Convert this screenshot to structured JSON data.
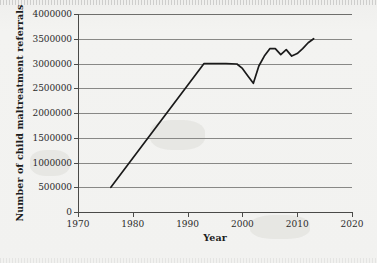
{
  "chart_data": {
    "type": "line",
    "title": "",
    "xlabel": "Year",
    "ylabel": "Number of child maltreatment referrals",
    "xlim": [
      1970,
      2020
    ],
    "ylim": [
      0,
      4000000
    ],
    "grid": true,
    "legend": false,
    "legend_position": "none",
    "xticks": [
      1970,
      1980,
      1990,
      2000,
      2010,
      2020
    ],
    "xtick_labels": [
      "1970",
      "1980",
      "1990",
      "2000",
      "2010",
      "2020"
    ],
    "yticks": [
      0,
      500000,
      1000000,
      1500000,
      2000000,
      2500000,
      3000000,
      3500000,
      4000000
    ],
    "ytick_labels": [
      "0",
      "500000",
      "1000000",
      "1500000",
      "2000000",
      "2500000",
      "3000000",
      "3500000",
      "4000000"
    ],
    "line_color": "#1a1a1a",
    "grid_color": "#888886",
    "background_color": "#f2f2f0",
    "series": [
      {
        "name": "Child maltreatment referrals",
        "x": [
          1976,
          1993,
          1995,
          1997,
          1999,
          2000,
          2001,
          2002,
          2003,
          2004,
          2005,
          2006,
          2007,
          2008,
          2009,
          2010,
          2011,
          2012,
          2013
        ],
        "values": [
          500000,
          3000000,
          3000000,
          3000000,
          2990000,
          2900000,
          2750000,
          2600000,
          2950000,
          3150000,
          3300000,
          3300000,
          3180000,
          3280000,
          3150000,
          3200000,
          3300000,
          3420000,
          3500000
        ]
      }
    ]
  },
  "axes": {
    "y_title": "Number of child maltreatment referrals",
    "x_title": "Year"
  }
}
